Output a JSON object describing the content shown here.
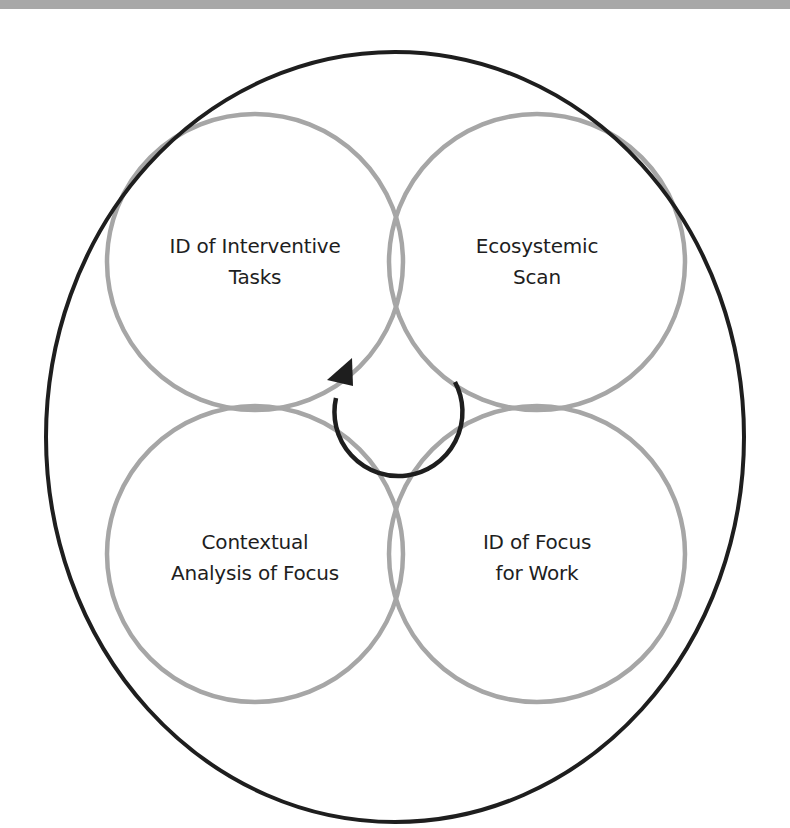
{
  "diagram": {
    "type": "four-circle cyclical overlap diagram within enclosing ellipse",
    "colors": {
      "background": "#ffffff",
      "inner_circle_stroke": "#a6a6a6",
      "outer_ellipse_stroke": "#1e1e1e",
      "cycle_arrow": "#1e1e1e",
      "label_text": "#1e1e1e",
      "top_band": "#a8a8a8"
    },
    "circles": [
      {
        "id": "top-left",
        "lines": [
          "ID of Interventive",
          "Tasks"
        ]
      },
      {
        "id": "top-right",
        "lines": [
          "Ecosystemic",
          "Scan"
        ]
      },
      {
        "id": "bottom-left",
        "lines": [
          "Contextual",
          "Analysis of Focus"
        ]
      },
      {
        "id": "bottom-right",
        "lines": [
          "ID of Focus",
          "for Work"
        ]
      }
    ],
    "center_arrow": {
      "direction": "clockwise",
      "icon": "cycle-arrow-icon"
    }
  }
}
